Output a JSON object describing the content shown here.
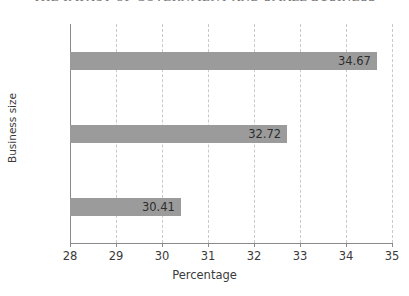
{
  "header": {
    "cropped_text": "THE IMPACT OF GOVERNMENT AND SMALL BUSINESS"
  },
  "chart_data": {
    "type": "bar",
    "orientation": "horizontal",
    "title": "",
    "xlabel": "Percentage",
    "ylabel": "Business size",
    "categories": [
      "Small",
      "Medium",
      "Large"
    ],
    "values": [
      34.67,
      32.72,
      30.41
    ],
    "value_labels": [
      "34.67",
      "32.72",
      "30.41"
    ],
    "xlim": [
      28,
      35
    ],
    "xticks": [
      28,
      29,
      30,
      31,
      32,
      33,
      34,
      35
    ],
    "xtick_labels": [
      "28",
      "29",
      "30",
      "31",
      "32",
      "33",
      "34",
      "35"
    ],
    "grid": "vertical-dashed",
    "legend": "none",
    "bar_color": "#9b9b9b",
    "axis_color": "#8a8a8a",
    "gridline_color": "#c9c9c9",
    "background": "#ffffff",
    "text_color": "#3a3a3a"
  }
}
